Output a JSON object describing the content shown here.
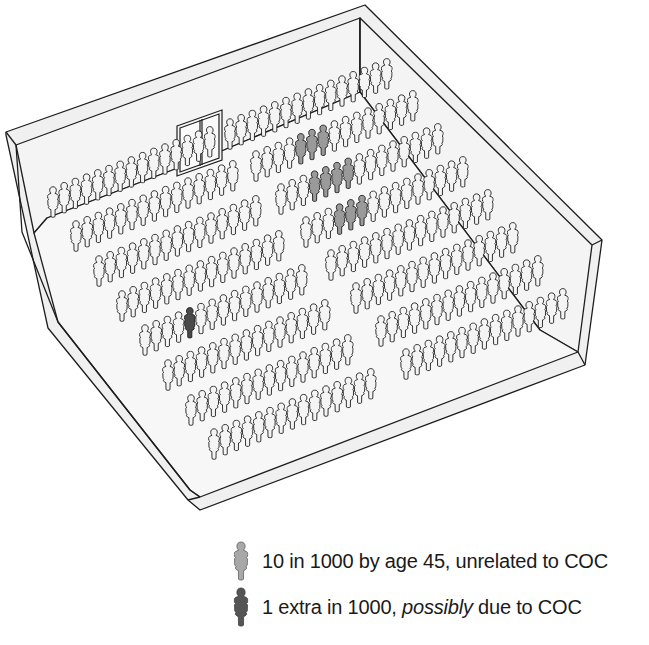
{
  "diagram": {
    "type": "icon-array-room",
    "total_people": 1000,
    "colors": {
      "normal_fill": "#f4f4f4",
      "outline": "#1e1e1e",
      "grey_fill": "#9a9a9a",
      "dark_fill": "#4a4a4a",
      "floor": "#f7f7f7",
      "wall": "#f2f2f2"
    },
    "left_block_rows": [
      {
        "x": 47,
        "y": 218,
        "count": 15
      },
      {
        "x": 70,
        "y": 252,
        "count": 15
      },
      {
        "x": 93,
        "y": 287,
        "count": 15
      },
      {
        "x": 116,
        "y": 322,
        "count": 15
      },
      {
        "x": 139,
        "y": 356,
        "count": 15
      },
      {
        "x": 162,
        "y": 391,
        "count": 15
      },
      {
        "x": 185,
        "y": 426,
        "count": 15
      },
      {
        "x": 208,
        "y": 460,
        "count": 15
      }
    ],
    "right_block_rows": [
      {
        "x": 224,
        "y": 150,
        "count": 15
      },
      {
        "x": 250,
        "y": 182,
        "count": 15
      },
      {
        "x": 275,
        "y": 215,
        "count": 15
      },
      {
        "x": 300,
        "y": 248,
        "count": 15
      },
      {
        "x": 325,
        "y": 281,
        "count": 15
      },
      {
        "x": 350,
        "y": 314,
        "count": 15
      },
      {
        "x": 375,
        "y": 347,
        "count": 15
      },
      {
        "x": 400,
        "y": 380,
        "count": 15
      }
    ],
    "highlighted": {
      "grey": [
        {
          "block": "right",
          "row": 1,
          "seats": [
            4,
            5,
            6
          ]
        },
        {
          "block": "right",
          "row": 2,
          "seats": [
            3,
            4,
            5,
            6
          ]
        },
        {
          "block": "right",
          "row": 3,
          "seats": [
            3,
            4,
            5
          ]
        }
      ],
      "dark": [
        {
          "block": "left",
          "row": 4,
          "seats": [
            4
          ]
        }
      ]
    },
    "door": {
      "label": "double-door"
    }
  },
  "legend": {
    "items": [
      {
        "icon": "person-icon-grey",
        "text": "10 in 1000 by age 45, unrelated to COC",
        "color": "#a8a8a8"
      },
      {
        "icon": "person-icon-dark",
        "text_before": "1 extra in 1000, ",
        "text_italic": "possibly",
        "text_after": " due to COC",
        "color": "#555555"
      }
    ]
  }
}
